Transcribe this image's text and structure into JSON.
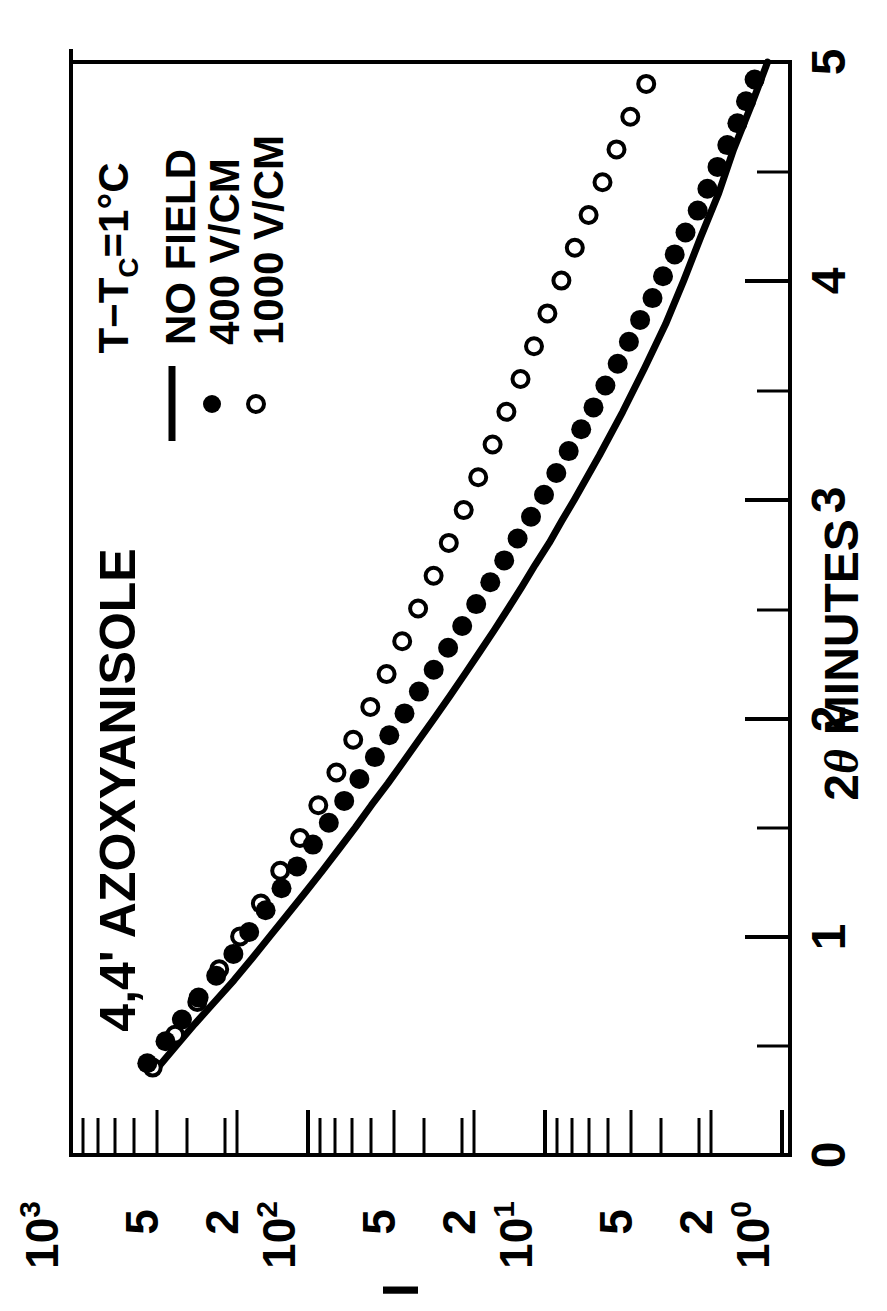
{
  "figure": {
    "title": "4,4' AZOXYANISOLE",
    "orientation": "rotated-90-ccw",
    "condition_note": "T−Tс = 1°C"
  },
  "annotations": {
    "sample": "4,4' AZOXYANISOLE",
    "temperature": "T−T",
    "temperature_sub": "C",
    "temperature_value": "=1°C"
  },
  "legend": {
    "position": "upper-left",
    "items": [
      {
        "marker": "line",
        "label": "NO FIELD"
      },
      {
        "marker": "filled-circle",
        "label": "400 V/CM"
      },
      {
        "marker": "open-circle",
        "label": "1000 V/CM"
      }
    ]
  },
  "axes": {
    "x": {
      "label": "2θ MINUTES",
      "label_pre": "2",
      "label_theta": "θ",
      "label_post": "MINUTES",
      "ticks": [
        "0",
        "1",
        "2",
        "3",
        "4",
        "5"
      ],
      "min": 0,
      "max": 5,
      "minor_per_major": 2,
      "scale": "linear"
    },
    "y": {
      "label": "I",
      "scale": "log",
      "min": 1,
      "max": 1000,
      "major_ticks": [
        "10⁰",
        "10¹",
        "10²",
        "10³"
      ],
      "major_values": [
        1,
        10,
        100,
        1000
      ],
      "labeled_ticks": [
        {
          "text": "10",
          "sup": "0",
          "value": 1
        },
        {
          "text": "2",
          "sup": "",
          "value": 2
        },
        {
          "text": "5",
          "sup": "",
          "value": 5
        },
        {
          "text": "10",
          "sup": "1",
          "value": 10
        },
        {
          "text": "2",
          "sup": "",
          "value": 20
        },
        {
          "text": "5",
          "sup": "",
          "value": 50
        },
        {
          "text": "10",
          "sup": "2",
          "value": 100
        },
        {
          "text": "2",
          "sup": "",
          "value": 200
        },
        {
          "text": "5",
          "sup": "",
          "value": 500
        },
        {
          "text": "10",
          "sup": "3",
          "value": 1000
        }
      ]
    }
  },
  "chart_data": {
    "type": "scatter",
    "title": "4,4' AZOXYANISOLE",
    "subtitle": "T−Tc = 1°C",
    "xlabel": "2θ MINUTES",
    "ylabel": "I",
    "xlim": [
      0,
      5
    ],
    "ylim": [
      1,
      1000
    ],
    "yscale": "log",
    "xscale": "linear",
    "grid": false,
    "legend_position": "upper-left",
    "series": [
      {
        "name": "NO FIELD",
        "style": "solid-line",
        "marker": "none",
        "x": [
          0.4,
          0.5,
          0.6,
          0.7,
          0.8,
          0.9,
          1.0,
          1.1,
          1.2,
          1.3,
          1.4,
          1.5,
          1.6,
          1.7,
          1.8,
          1.9,
          2.0,
          2.1,
          2.2,
          2.3,
          2.4,
          2.5,
          2.6,
          2.7,
          2.8,
          2.9,
          3.0,
          3.2,
          3.4,
          3.6,
          3.8,
          4.0,
          4.2,
          4.4,
          4.6,
          4.8,
          5.0
        ],
        "y": [
          430,
          360,
          300,
          248,
          205,
          172,
          145,
          122,
          103,
          87,
          74,
          63,
          54,
          46,
          39.5,
          34,
          29.2,
          25.2,
          21.8,
          18.9,
          16.4,
          14.3,
          12.5,
          11.0,
          9.6,
          8.5,
          7.5,
          5.9,
          4.7,
          3.8,
          3.1,
          2.6,
          2.2,
          1.85,
          1.6,
          1.35,
          1.15
        ]
      },
      {
        "name": "400 V/CM",
        "style": "markers",
        "marker": "filled-circle",
        "x": [
          0.42,
          0.52,
          0.62,
          0.72,
          0.82,
          0.92,
          1.02,
          1.12,
          1.22,
          1.32,
          1.42,
          1.52,
          1.62,
          1.72,
          1.82,
          1.92,
          2.02,
          2.12,
          2.22,
          2.32,
          2.42,
          2.52,
          2.62,
          2.72,
          2.82,
          2.92,
          3.02,
          3.12,
          3.22,
          3.32,
          3.42,
          3.52,
          3.62,
          3.72,
          3.82,
          3.92,
          4.02,
          4.12,
          4.22,
          4.32,
          4.42,
          4.52,
          4.62,
          4.72,
          4.82,
          4.92
        ],
        "y": [
          420,
          352,
          300,
          255,
          215,
          182,
          156,
          133,
          114,
          98,
          84,
          72,
          62,
          53.5,
          46,
          40,
          34.5,
          30,
          26,
          22.6,
          19.7,
          17.2,
          15.0,
          13.1,
          11.5,
          10.1,
          8.9,
          7.9,
          7.0,
          6.2,
          5.5,
          4.9,
          4.35,
          3.9,
          3.5,
          3.1,
          2.8,
          2.5,
          2.25,
          2.0,
          1.82,
          1.65,
          1.5,
          1.36,
          1.25,
          1.15
        ]
      },
      {
        "name": "1000 V/CM",
        "style": "markers",
        "marker": "open-circle",
        "x": [
          0.4,
          0.55,
          0.7,
          0.85,
          1.0,
          1.15,
          1.3,
          1.45,
          1.6,
          1.75,
          1.9,
          2.05,
          2.2,
          2.35,
          2.5,
          2.65,
          2.8,
          2.95,
          3.1,
          3.25,
          3.4,
          3.55,
          3.7,
          3.85,
          4.0,
          4.15,
          4.3,
          4.45,
          4.6,
          4.75,
          4.9
        ],
        "y": [
          435,
          350,
          282,
          228,
          186,
          152,
          126,
          104,
          87,
          73,
          62,
          52.5,
          44.8,
          38.5,
          33.0,
          28.4,
          24.5,
          21.2,
          18.4,
          16.0,
          14.0,
          12.2,
          10.7,
          9.4,
          8.2,
          7.2,
          6.3,
          5.5,
          4.8,
          4.2,
          3.6
        ]
      }
    ]
  },
  "colors": {
    "ink": "#000000",
    "paper": "#ffffff"
  }
}
